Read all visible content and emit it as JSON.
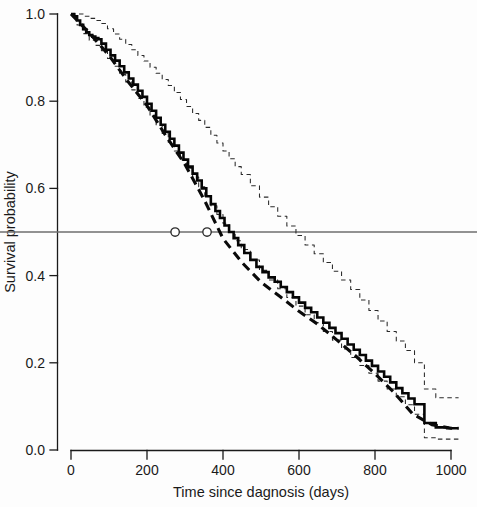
{
  "figure": {
    "background_color": "#fdfdfd",
    "foreground_color": "#1a1a1a"
  },
  "chart_data": {
    "type": "line",
    "title": "",
    "subtitle": "",
    "xlabel": "Time since dagnosis (days)",
    "ylabel": "Survival probability",
    "xlim": [
      0,
      1020
    ],
    "ylim": [
      0.0,
      1.0
    ],
    "xticks": [
      0,
      200,
      400,
      600,
      800,
      1000
    ],
    "xticklabels": [
      "0",
      "200",
      "400",
      "600",
      "800",
      "1000"
    ],
    "yticks": [
      0.0,
      0.2,
      0.4,
      0.6,
      0.8,
      1.0
    ],
    "yticklabels": [
      "0.0",
      "0.2",
      "0.4",
      "0.6",
      "0.8",
      "1.0"
    ],
    "grid": false,
    "legend": null,
    "legend_position": "none",
    "annotations": [
      {
        "name": "median-survival-reference",
        "type": "hline",
        "y": 0.5,
        "color": "#6e6e6e",
        "label": ""
      },
      {
        "name": "median-ci-lower-marker",
        "type": "point",
        "x": 274,
        "y": 0.5,
        "marker": "open-circle"
      },
      {
        "name": "median-ci-upper-marker",
        "type": "point",
        "x": 358,
        "y": 0.5,
        "marker": "open-circle"
      }
    ],
    "series": [
      {
        "name": "Kaplan-Meier estimate",
        "style": "step-solid",
        "color": "#050505",
        "x": [
          0,
          8,
          16,
          24,
          32,
          40,
          48,
          56,
          64,
          72,
          80,
          92,
          104,
          116,
          128,
          140,
          152,
          164,
          176,
          188,
          200,
          212,
          224,
          236,
          248,
          260,
          272,
          284,
          296,
          308,
          320,
          332,
          344,
          356,
          368,
          380,
          392,
          404,
          416,
          428,
          440,
          456,
          472,
          488,
          504,
          520,
          536,
          552,
          568,
          584,
          600,
          616,
          632,
          648,
          664,
          680,
          696,
          712,
          728,
          744,
          760,
          776,
          792,
          808,
          824,
          840,
          856,
          872,
          888,
          904,
          930,
          960,
          990,
          1020
        ],
        "y": [
          1.0,
          0.995,
          0.985,
          0.975,
          0.965,
          0.958,
          0.952,
          0.948,
          0.945,
          0.942,
          0.932,
          0.918,
          0.905,
          0.893,
          0.88,
          0.866,
          0.852,
          0.838,
          0.824,
          0.81,
          0.794,
          0.778,
          0.762,
          0.746,
          0.73,
          0.714,
          0.698,
          0.682,
          0.666,
          0.65,
          0.634,
          0.618,
          0.6,
          0.582,
          0.564,
          0.548,
          0.532,
          0.515,
          0.5,
          0.486,
          0.47,
          0.452,
          0.436,
          0.42,
          0.408,
          0.396,
          0.386,
          0.374,
          0.362,
          0.35,
          0.338,
          0.326,
          0.316,
          0.304,
          0.292,
          0.28,
          0.268,
          0.255,
          0.242,
          0.23,
          0.218,
          0.205,
          0.193,
          0.18,
          0.168,
          0.155,
          0.142,
          0.13,
          0.118,
          0.105,
          0.062,
          0.052,
          0.05,
          0.05
        ]
      },
      {
        "name": "Upper 95% confidence limit",
        "style": "step-dashed",
        "color": "#2a2a2a",
        "x": [
          0,
          16,
          32,
          48,
          64,
          80,
          96,
          112,
          128,
          144,
          160,
          176,
          192,
          208,
          224,
          240,
          256,
          272,
          288,
          304,
          320,
          336,
          352,
          368,
          384,
          400,
          416,
          432,
          448,
          472,
          496,
          520,
          544,
          568,
          592,
          616,
          640,
          664,
          688,
          712,
          736,
          760,
          784,
          808,
          832,
          856,
          880,
          904,
          930,
          960,
          990,
          1020
        ],
        "y": [
          1.0,
          1.0,
          0.995,
          0.99,
          0.985,
          0.978,
          0.966,
          0.954,
          0.942,
          0.93,
          0.918,
          0.905,
          0.892,
          0.878,
          0.864,
          0.85,
          0.836,
          0.82,
          0.804,
          0.788,
          0.772,
          0.756,
          0.74,
          0.722,
          0.704,
          0.686,
          0.668,
          0.65,
          0.632,
          0.606,
          0.58,
          0.558,
          0.536,
          0.514,
          0.492,
          0.47,
          0.45,
          0.43,
          0.41,
          0.39,
          0.368,
          0.344,
          0.32,
          0.296,
          0.272,
          0.25,
          0.228,
          0.2,
          0.14,
          0.12,
          0.12,
          0.12
        ]
      },
      {
        "name": "Lower 95% confidence limit",
        "style": "step-dashed",
        "color": "#2a2a2a",
        "x": [
          0,
          16,
          32,
          48,
          64,
          80,
          96,
          112,
          128,
          144,
          160,
          176,
          192,
          208,
          224,
          240,
          256,
          272,
          288,
          304,
          320,
          336,
          352,
          368,
          384,
          400,
          416,
          432,
          448,
          472,
          496,
          520,
          544,
          568,
          592,
          616,
          640,
          664,
          688,
          712,
          736,
          760,
          784,
          808,
          832,
          856,
          880,
          904,
          930,
          960,
          990,
          1020
        ],
        "y": [
          1.0,
          0.975,
          0.955,
          0.94,
          0.928,
          0.916,
          0.898,
          0.88,
          0.862,
          0.844,
          0.826,
          0.806,
          0.786,
          0.766,
          0.746,
          0.726,
          0.706,
          0.686,
          0.666,
          0.646,
          0.626,
          0.604,
          0.582,
          0.56,
          0.54,
          0.52,
          0.5,
          0.48,
          0.46,
          0.436,
          0.412,
          0.39,
          0.37,
          0.35,
          0.33,
          0.31,
          0.292,
          0.272,
          0.252,
          0.232,
          0.212,
          0.194,
          0.176,
          0.158,
          0.14,
          0.122,
          0.104,
          0.082,
          0.028,
          0.025,
          0.025,
          0.025
        ]
      },
      {
        "name": "Fitted parametric curve",
        "style": "dashed-overlay",
        "color": "#0a0a0a",
        "x": [
          0,
          50,
          100,
          150,
          200,
          250,
          300,
          350,
          400,
          450,
          500,
          550,
          600,
          650,
          700,
          750,
          800,
          850,
          900,
          950,
          1000,
          1020
        ],
        "y": [
          1.0,
          0.955,
          0.905,
          0.845,
          0.79,
          0.72,
          0.655,
          0.575,
          0.485,
          0.43,
          0.385,
          0.352,
          0.318,
          0.288,
          0.252,
          0.215,
          0.175,
          0.132,
          0.082,
          0.058,
          0.05,
          0.05
        ]
      }
    ]
  }
}
